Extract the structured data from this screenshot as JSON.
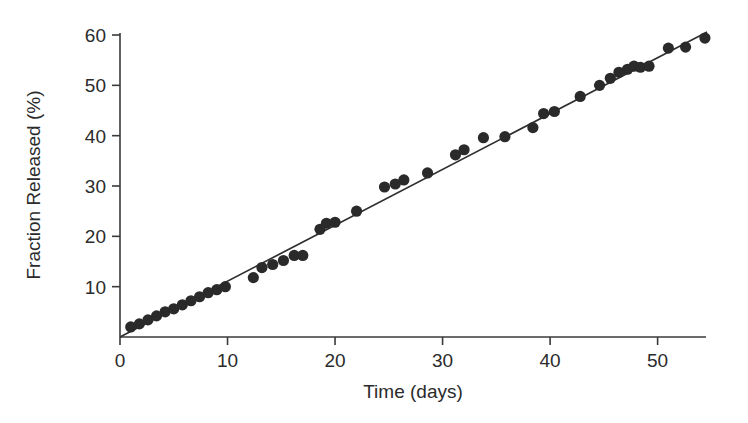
{
  "chart_data": {
    "type": "scatter",
    "title": "",
    "xlabel": "Time (days)",
    "ylabel": "Fraction Released (%)",
    "xlim": [
      0,
      54.5
    ],
    "ylim": [
      0,
      60.4
    ],
    "xticks": [
      0,
      10,
      20,
      30,
      40,
      50
    ],
    "yticks": [
      10,
      20,
      30,
      40,
      50,
      60
    ],
    "xtick_labels": [
      "0",
      "10",
      "20",
      "30",
      "40",
      "50"
    ],
    "ytick_labels": [
      "10",
      "20",
      "30",
      "40",
      "50",
      "60"
    ],
    "grid": false,
    "legend": null,
    "legend_position": "none",
    "series": [
      {
        "name": "Fraction released",
        "marker": "filled-circle",
        "color": "#2a2a2a",
        "x": [
          1.0,
          1.8,
          2.6,
          3.4,
          4.2,
          5.0,
          5.8,
          6.6,
          7.4,
          8.2,
          9.0,
          9.8,
          12.4,
          13.2,
          14.2,
          15.2,
          16.2,
          17.0,
          18.6,
          19.2,
          20.0,
          22.0,
          24.6,
          25.6,
          26.4,
          28.6,
          31.2,
          32.0,
          33.8,
          35.8,
          38.4,
          39.4,
          40.4,
          42.8,
          44.6,
          45.6,
          46.4,
          47.2,
          47.8,
          48.4,
          49.2,
          51.0,
          52.6,
          54.4
        ],
        "y": [
          2.0,
          2.6,
          3.4,
          4.2,
          5.0,
          5.6,
          6.4,
          7.2,
          8.0,
          8.8,
          9.4,
          10.0,
          11.8,
          13.8,
          14.4,
          15.2,
          16.2,
          16.2,
          21.4,
          22.6,
          22.8,
          25.0,
          29.8,
          30.4,
          31.2,
          32.6,
          36.2,
          37.2,
          39.6,
          39.8,
          41.6,
          44.4,
          44.8,
          47.8,
          50.0,
          51.4,
          52.6,
          53.2,
          53.8,
          53.6,
          53.8,
          57.4,
          57.6,
          59.4
        ]
      }
    ],
    "fit_line": {
      "name": "linear fit",
      "color": "#2f2f2f",
      "x": [
        0.0,
        54.6
      ],
      "y": [
        0.0,
        60.6
      ]
    }
  }
}
